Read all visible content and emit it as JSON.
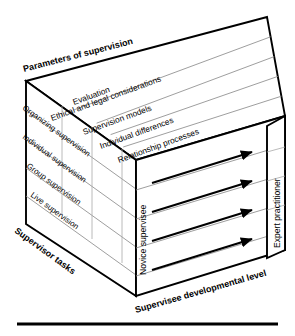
{
  "diagram": {
    "axes": {
      "top": "Parameters of supervision",
      "left": "Supervisor tasks",
      "front": "Supervisee developmental level"
    },
    "top_face": {
      "axis_label": "Parameters of supervision",
      "bands": [
        "Evaluation",
        "Ethical and legal considerations",
        "Supervision models",
        "Individual differences",
        "Relationship processes"
      ]
    },
    "left_face": {
      "axis_label": "Supervisor tasks",
      "bands": [
        "Organizing supervision",
        "Individual supervision",
        "Group supervision",
        "Live supervision"
      ]
    },
    "front_face": {
      "axis_label": "Supervisee developmental level",
      "start_label": "Novice supervisee",
      "end_label": "Expert practitioner",
      "arrow_count": 4,
      "arrow_direction": "left-to-right"
    },
    "colors": {
      "outline": "#000000",
      "band_line": "#8d8d8d",
      "tick_line": "#a8a8a8",
      "background": "#ffffff",
      "rule": "#000000"
    }
  }
}
